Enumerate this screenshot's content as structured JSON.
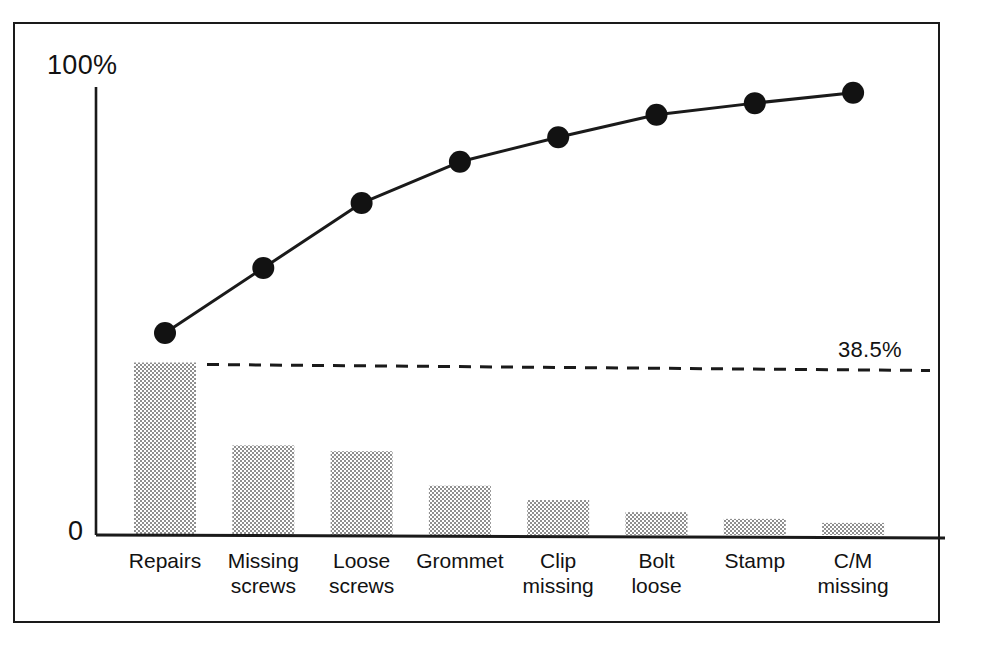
{
  "figure": {
    "frame": true,
    "background": "#ffffff",
    "ink_color": "#121212",
    "bar_fill": "#a9a9a9"
  },
  "axis": {
    "y_top_label": "100%",
    "y_bottom_label": "0",
    "threshold_label": "38.5%"
  },
  "chart_data": {
    "type": "bar",
    "title": "",
    "subtitle": "",
    "xlabel": "",
    "ylabel": "",
    "ylim": [
      0,
      100
    ],
    "grid": false,
    "legend": "none",
    "categories": [
      "Repairs",
      "Missing\nscrews",
      "Loose\nscrews",
      "Grommet",
      "Clip\nmissing",
      "Bolt\nloose",
      "Stamp",
      "C/M\nmissing"
    ],
    "tick_labels": [
      "Repairs",
      "Missing screws",
      "Loose screws",
      "Grommet",
      "Clip missing",
      "Bolt loose",
      "Stamp",
      "C/M missing"
    ],
    "series": [
      {
        "name": "Frequency",
        "type": "bar",
        "values": [
          38.5,
          20.0,
          18.7,
          11.0,
          7.8,
          5.1,
          3.6,
          2.7
        ]
      },
      {
        "name": "Cumulative percentage",
        "type": "line",
        "values": [
          45.1,
          59.6,
          74.1,
          83.3,
          88.8,
          93.8,
          96.4,
          98.7
        ]
      }
    ],
    "annotations": [
      {
        "text": "38.5%",
        "type": "threshold-line",
        "style": "dashed",
        "value": 38.5
      }
    ],
    "y_ticks": [
      0,
      100
    ],
    "y_tick_labels": [
      "0",
      "100%"
    ]
  }
}
